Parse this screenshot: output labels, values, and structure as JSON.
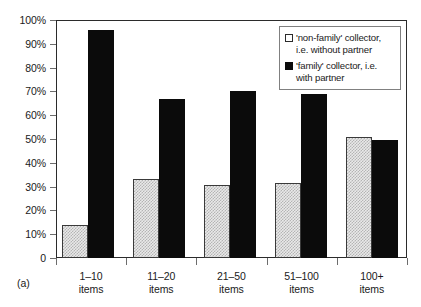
{
  "figure": {
    "label": "(a)"
  },
  "legend": {
    "position": "top-right",
    "entries": [
      {
        "swatch": "light-checkered-square",
        "line1": "'non-family' collector,",
        "line2": "i.e. without partner",
        "full": "'non-family' collector, i.e. without partner"
      },
      {
        "swatch": "black-square",
        "line1": "'family' collector, i.e.",
        "line2": "with partner",
        "full": "'family' collector, i.e. with partner"
      }
    ]
  },
  "axes": {
    "y_tick_labels": [
      "100%",
      "90%",
      "80%",
      "70%",
      "60%",
      "50%",
      "40%",
      "30%",
      "20%",
      "10%",
      "0"
    ],
    "x_tick_labels": [
      {
        "line1": "1–10",
        "line2": "items"
      },
      {
        "line1": "11–20",
        "line2": "items"
      },
      {
        "line1": "21–50",
        "line2": "items"
      },
      {
        "line1": "51–100",
        "line2": "items"
      },
      {
        "line1": "100+",
        "line2": "items"
      }
    ]
  },
  "colors": {
    "series_non_family": "#e9e9e9",
    "series_family": "#0b0b0b",
    "axis": "#2b2b2b",
    "tick": "#6d6d6d",
    "background": "#ffffff"
  },
  "chart_data": {
    "type": "bar",
    "title": "",
    "subtitle": "",
    "xlabel": "",
    "ylabel": "",
    "ylim": [
      0,
      100
    ],
    "yticks": [
      0,
      10,
      20,
      30,
      40,
      50,
      60,
      70,
      80,
      90,
      100
    ],
    "ytick_format": "percent",
    "grid": false,
    "legend_position": "top-right",
    "categories": [
      "1–10 items",
      "11–20 items",
      "21–50 items",
      "51–100 items",
      "100+ items"
    ],
    "series": [
      {
        "name": "'non-family' collector, i.e. without partner",
        "color": "#e9e9e9",
        "values": [
          14,
          33,
          30.5,
          31.5,
          51
        ]
      },
      {
        "name": "'family' collector, i.e. with partner",
        "color": "#0b0b0b",
        "values": [
          96,
          67,
          70,
          69,
          49.5
        ]
      }
    ]
  }
}
